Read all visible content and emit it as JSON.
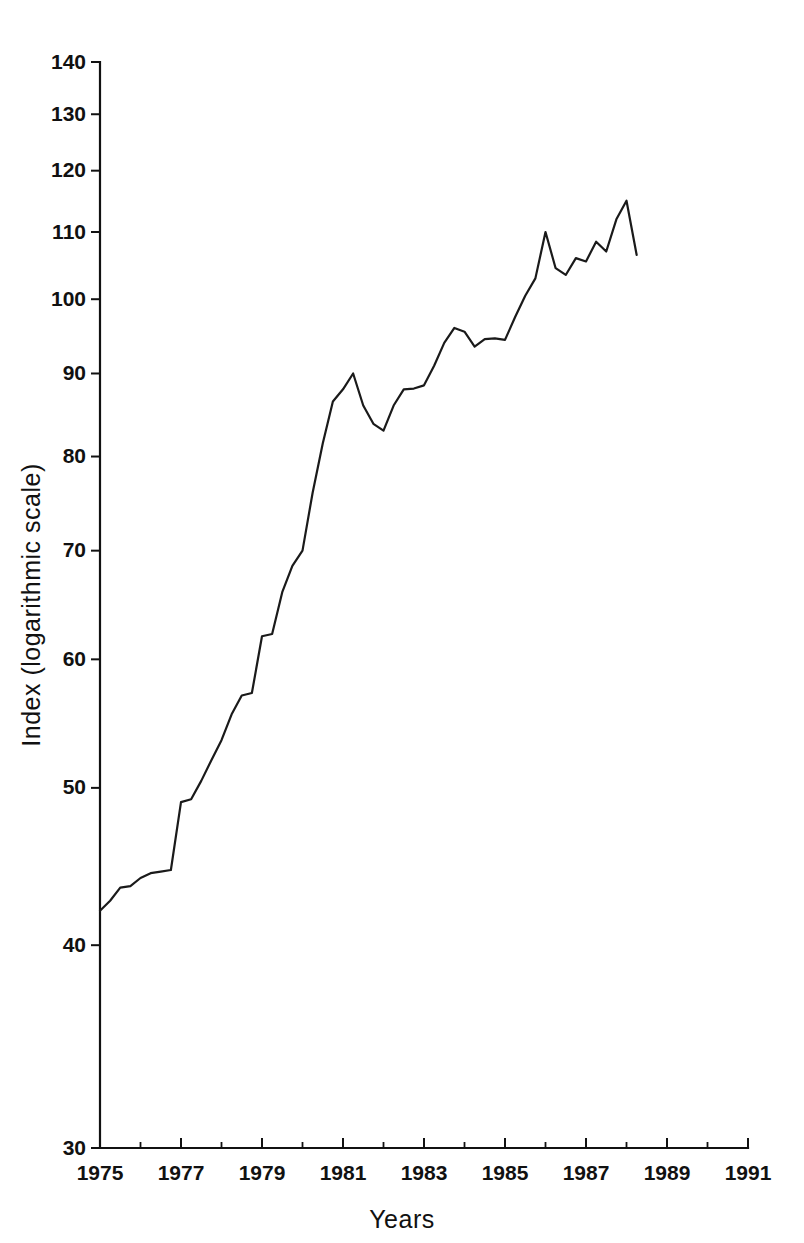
{
  "chart_data": {
    "type": "line",
    "title": "",
    "xlabel": "Years",
    "ylabel": "Index (logarithmic scale)",
    "yscale": "log",
    "ylim": [
      30,
      140
    ],
    "xlim": [
      1975,
      1991
    ],
    "grid": false,
    "legend": null,
    "y_ticks": [
      30,
      40,
      50,
      60,
      70,
      80,
      90,
      100,
      110,
      120,
      130,
      140
    ],
    "y_tick_labels": [
      "30",
      "40",
      "50",
      "60",
      "70",
      "80",
      "90",
      "100",
      "110",
      "120",
      "130",
      "140"
    ],
    "x_ticks": [
      1975,
      1976,
      1977,
      1978,
      1979,
      1980,
      1981,
      1982,
      1983,
      1984,
      1985,
      1986,
      1987,
      1988,
      1989,
      1990,
      1991
    ],
    "x_major_ticks": [
      1975,
      1977,
      1979,
      1981,
      1983,
      1985,
      1987,
      1989,
      1991
    ],
    "x_tick_labels": [
      "1975",
      "1977",
      "1979",
      "1981",
      "1983",
      "1985",
      "1987",
      "1989",
      "1991"
    ],
    "series": [
      {
        "name": "Index",
        "color": "#1a1a1a",
        "x": [
          1975.0,
          1975.25,
          1975.5,
          1975.75,
          1976.0,
          1976.25,
          1976.5,
          1976.75,
          1977.0,
          1977.25,
          1977.5,
          1977.75,
          1978.0,
          1978.25,
          1978.5,
          1978.75,
          1979.0,
          1979.25,
          1979.5,
          1979.75,
          1980.0,
          1980.25,
          1980.5,
          1980.75,
          1981.0,
          1981.25,
          1981.5,
          1981.75,
          1982.0,
          1982.25,
          1982.5,
          1982.75,
          1983.0,
          1983.25,
          1983.5,
          1983.75,
          1984.0,
          1984.25,
          1984.5,
          1984.75,
          1985.0,
          1985.25,
          1985.5,
          1985.75,
          1986.0,
          1986.25,
          1986.5,
          1986.75,
          1987.0,
          1987.25,
          1987.5,
          1987.75,
          1988.0,
          1988.25
        ],
        "values": [
          42.0,
          42.6,
          43.4,
          43.5,
          44.0,
          44.3,
          44.4,
          44.5,
          49.0,
          49.2,
          50.5,
          52.0,
          53.5,
          55.5,
          57.0,
          57.2,
          62.0,
          62.2,
          66.0,
          68.5,
          70.0,
          76.0,
          81.5,
          86.5,
          88.0,
          90.0,
          86.0,
          83.8,
          83.0,
          86.0,
          88.0,
          88.1,
          88.5,
          91.0,
          94.0,
          96.0,
          95.5,
          93.5,
          94.5,
          94.6,
          94.4,
          97.5,
          100.5,
          103.0,
          110.0,
          104.5,
          103.5,
          106.0,
          105.5,
          108.5,
          107.0,
          112.0,
          115.0,
          106.5
        ]
      }
    ]
  },
  "axis": {
    "x_title": "Years",
    "y_title": "Index (logarithmic scale)"
  }
}
